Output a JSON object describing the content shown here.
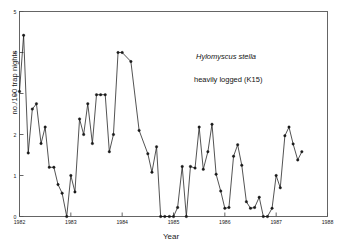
{
  "chart_data": {
    "type": "line",
    "title": "",
    "xlabel": "Year",
    "ylabel": "no./100 trap nights",
    "xlim": [
      1982,
      1988
    ],
    "ylim": [
      0,
      5
    ],
    "xticks": [
      1982,
      1983,
      1984,
      1985,
      1986,
      1987,
      1988
    ],
    "xtick_labels": [
      "1982",
      "1983",
      "1984",
      "1985",
      "1986",
      "1987",
      "1988"
    ],
    "yticks": [
      0,
      1,
      2,
      3,
      4,
      5
    ],
    "ytick_labels": [
      "0",
      "1",
      "2",
      "3",
      "4",
      "5"
    ],
    "grid": false,
    "legend": "none",
    "markers": "filled-circle",
    "line_color": "#1a1a1a",
    "marker_color": "#1a1a1a",
    "annotations": [
      {
        "text": "Hylomyscus stella",
        "style": "italic",
        "x": 1985.95,
        "y": 3.55
      },
      {
        "text": "heavily logged (K15)",
        "style": "normal",
        "x": 1985.9,
        "y": 2.98
      }
    ],
    "series": [
      {
        "name": "Hylomyscus stella abundance",
        "x": [
          1982.0,
          1982.08,
          1982.17,
          1982.25,
          1982.33,
          1982.42,
          1982.5,
          1982.58,
          1982.67,
          1982.75,
          1982.83,
          1982.92,
          1983.0,
          1983.08,
          1983.17,
          1983.25,
          1983.33,
          1983.42,
          1983.5,
          1983.58,
          1983.67,
          1983.75,
          1983.83,
          1983.92,
          1984.0,
          1984.17,
          1984.33,
          1984.5,
          1984.58,
          1984.67,
          1984.75,
          1984.83,
          1984.92,
          1985.0,
          1985.08,
          1985.17,
          1985.25,
          1985.33,
          1985.42,
          1985.5,
          1985.58,
          1985.67,
          1985.75,
          1985.83,
          1985.92,
          1986.0,
          1986.08,
          1986.17,
          1986.25,
          1986.33,
          1986.42,
          1986.5,
          1986.58,
          1986.67,
          1986.75,
          1986.83,
          1986.92,
          1987.0,
          1987.08,
          1987.17,
          1987.25,
          1987.33,
          1987.42,
          1987.5
        ],
        "y": [
          3.05,
          4.42,
          1.55,
          2.62,
          2.75,
          1.78,
          2.18,
          1.2,
          1.2,
          0.78,
          0.57,
          0.0,
          1.0,
          0.6,
          2.38,
          2.0,
          2.75,
          1.78,
          2.97,
          2.97,
          2.97,
          1.58,
          2.0,
          4.0,
          4.0,
          3.78,
          2.1,
          1.53,
          1.08,
          1.7,
          0.0,
          0.0,
          0.0,
          0.0,
          0.22,
          1.22,
          0.0,
          1.22,
          1.18,
          2.18,
          1.15,
          1.58,
          2.25,
          1.03,
          0.62,
          0.2,
          0.22,
          1.47,
          1.75,
          1.25,
          0.36,
          0.2,
          0.22,
          0.47,
          0.0,
          0.0,
          0.2,
          1.0,
          0.7,
          1.97,
          2.18,
          1.77,
          1.38,
          1.58
        ],
        "values_note": "Monthly/periodic trap success values read from the plotted markers"
      }
    ]
  },
  "figure": {
    "frame_color": "#444444",
    "background": "#ffffff",
    "axis_label_x": "Year",
    "axis_label_y": "no./100 trap nights"
  }
}
